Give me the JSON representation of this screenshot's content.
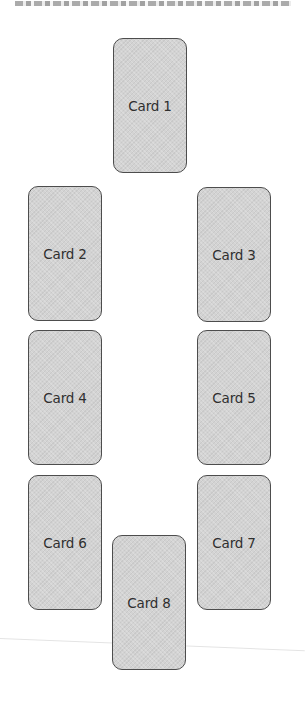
{
  "diagram": {
    "type": "card-spread-layout",
    "colors": {
      "background": "#ffffff",
      "card_fill": "#d3d3d3",
      "card_border": "#4d4d4d",
      "label_text": "#2f2f2f"
    },
    "cards": [
      {
        "label": "Card 1",
        "x": 113,
        "y": 38
      },
      {
        "label": "Card 2",
        "x": 28,
        "y": 186
      },
      {
        "label": "Card 3",
        "x": 197,
        "y": 187
      },
      {
        "label": "Card 4",
        "x": 28,
        "y": 330
      },
      {
        "label": "Card 5",
        "x": 197,
        "y": 330
      },
      {
        "label": "Card 6",
        "x": 28,
        "y": 475
      },
      {
        "label": "Card 7",
        "x": 197,
        "y": 475
      },
      {
        "label": "Card 8",
        "x": 112,
        "y": 535
      }
    ]
  }
}
